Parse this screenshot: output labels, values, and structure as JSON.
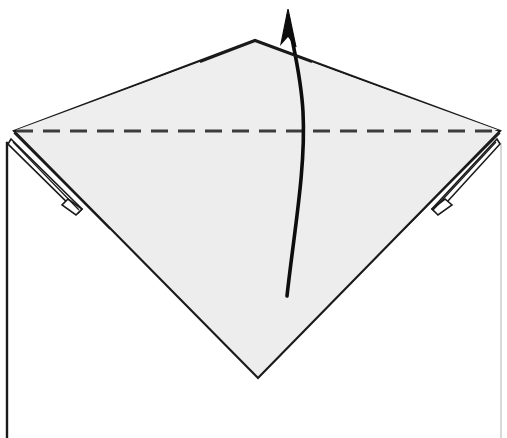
{
  "figure": {
    "caption_fragment": "",
    "canvas": {
      "width": 507,
      "height": 438
    },
    "colors": {
      "page_background": "#ffffff",
      "paper_fill": "#ededed",
      "paper_fill_light": "#f6f6f6",
      "stroke": "#1a1a1a",
      "stroke_soft": "#4a4a4a",
      "dash_stroke": "#3c3c3c",
      "arrow_stroke": "#0d0d0d"
    },
    "shapes": {
      "diamond": {
        "name": "front-flap-diamond",
        "points": "14,131 255,40 500,131 258,378",
        "fill": "#ededed",
        "stroke": "#1a1a1a",
        "stroke_width": 2.2
      },
      "lower_body": {
        "name": "base-paper-body",
        "points": "7,143 7,438 500,438 500,143",
        "fill": "#ffffff",
        "stroke": "none"
      },
      "left_body_edge": {
        "name": "left-body-edge",
        "x1": 7,
        "y1": 143,
        "x2": 7,
        "y2": 438,
        "stroke_width": 2.4
      },
      "right_body_edge": {
        "name": "right-body-edge",
        "x1": 501,
        "y1": 143,
        "x2": 501,
        "y2": 438,
        "stroke_width": 1.0
      },
      "dashed_fold": {
        "name": "valley-fold-line",
        "x1": 16,
        "y1": 131,
        "x2": 498,
        "y2": 131,
        "stroke": "#3c3c3c",
        "stroke_width": 3.0,
        "dash_array": "17 10",
        "label": "valley fold"
      },
      "left_sliver": {
        "name": "left-corner-sliver-flap",
        "outer": "11,139 82,209 78,213 8,144",
        "inner_line": "13,143 80,212",
        "notch": "68,199 82,209 76,215 62,205"
      },
      "right_sliver": {
        "name": "right-corner-sliver-flap",
        "outer": "497,139 432,209 437,213 500,144",
        "inner_line": "495,143 434,212",
        "notch": "445,199 432,209 438,215 452,205"
      },
      "left_under_edge": {
        "name": "left-under-crease",
        "path": "M 14,133 L 110,229"
      },
      "right_under_edge": {
        "name": "right-under-crease",
        "path": "M 500,133 L 404,229"
      },
      "arrow": {
        "name": "fold-direction-arrow",
        "tail_x": 287,
        "tail_y": 296,
        "head_x": 288,
        "head_y": 9,
        "path": "M 287,296 C 294,232 306,168 303,112 C 301,72 291,40 288,16",
        "head_path": "M 288,9 L 281,44 L 288,36 L 296,47 Z",
        "stroke": "#0d0d0d",
        "stroke_width": 3.6,
        "label": "fold up"
      }
    },
    "annotations": {
      "fold_type": "valley fold",
      "direction": "up",
      "step_note": ""
    }
  }
}
